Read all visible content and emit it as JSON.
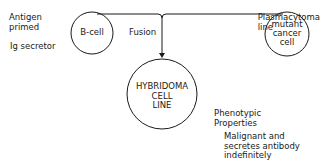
{
  "diagram": {
    "left_notes": {
      "antigen": "Antigen\nprimed",
      "secretor": "Ig secretor"
    },
    "nodes": {
      "b_cell": "B-cell",
      "mutant": "mutant\ncancer\ncell",
      "hybridoma": "HYBRIDOMA\nCELL\nLINE"
    },
    "edge_label": "Fusion",
    "right_note": "Plasmacytoma\nline",
    "phenotypic": {
      "title": "Phenotypic\nProperties",
      "body": "Malignant and\nsecretes antibody\nindefinitely"
    },
    "colors": {
      "line": "#1a1a1a",
      "background": "#ffffff"
    }
  }
}
